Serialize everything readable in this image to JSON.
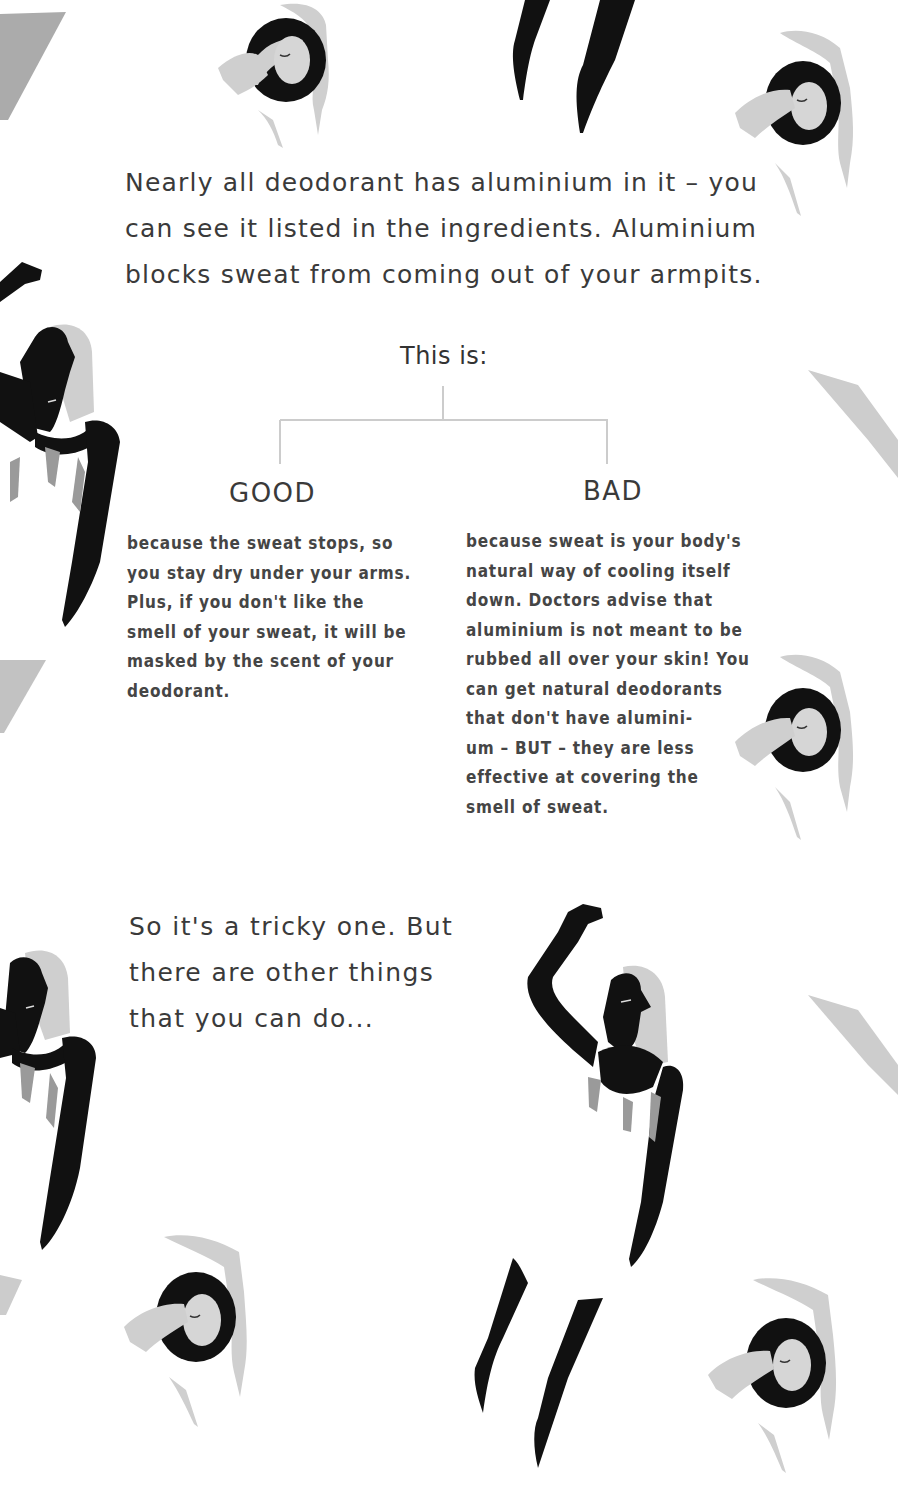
{
  "intro": {
    "lines": [
      "Nearly all deodorant has aluminium in it – you",
      "can see it listed in the ingredients. Aluminium",
      "blocks sweat from coming out of your armpits."
    ]
  },
  "diagram": {
    "root_label": "This is:",
    "branches": [
      {
        "heading": "GOOD",
        "lines": [
          "because the sweat stops, so",
          "you stay dry under your arms.",
          "Plus, if you don't like the",
          "smell of your sweat, it will be",
          "masked by the scent of your",
          "deodorant."
        ]
      },
      {
        "heading": "BAD",
        "lines": [
          "because sweat is your body's",
          "natural way of cooling itself",
          "down. Doctors advise that",
          "aluminium is not meant to be",
          "rubbed all over your skin! You",
          "can get natural deodorants",
          "that don't have alumini-",
          "um – BUT – they are less",
          "effective at covering the",
          "smell of sweat."
        ]
      }
    ]
  },
  "outro": {
    "lines": [
      "So it's a tricky one. But",
      "there are other things",
      "that you can do..."
    ]
  },
  "colors": {
    "text": "#3a3a3a",
    "figure_black": "#111111",
    "figure_gray": "#c8c8c8",
    "figure_dark_gray": "#9a9a9a",
    "connector": "#cccccc"
  },
  "illustrations": [
    "reclining-woman-figure",
    "legs-figure",
    "standing-woman-arm-raised-figure",
    "gray-shape"
  ]
}
